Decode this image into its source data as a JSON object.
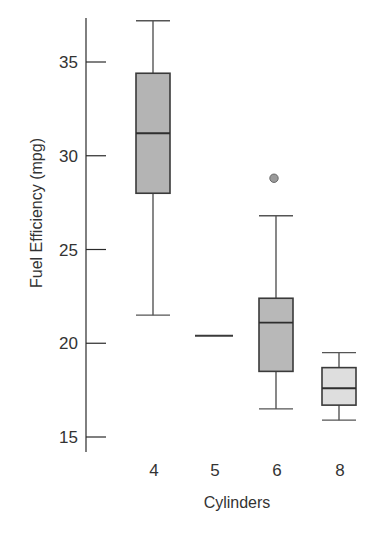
{
  "chart_data": {
    "type": "box",
    "title": "",
    "xlabel": "Cylinders",
    "ylabel": "Fuel Efficiency (mpg)",
    "ylim": [
      15,
      37.5
    ],
    "yticks": [
      15,
      20,
      25,
      30,
      35
    ],
    "grid": false,
    "legend": null,
    "categories": [
      "4",
      "5",
      "6",
      "8"
    ],
    "series": [
      {
        "name": "4",
        "whisker_low": 21.5,
        "q1": 28.0,
        "median": 31.2,
        "q3": 34.4,
        "whisker_high": 37.2,
        "outliers": [],
        "fill": "#b4b4b4"
      },
      {
        "name": "5",
        "whisker_low": 20.4,
        "q1": 20.4,
        "median": 20.4,
        "q3": 20.4,
        "whisker_high": 20.4,
        "outliers": [],
        "fill": "#b4b4b4"
      },
      {
        "name": "6",
        "whisker_low": 16.5,
        "q1": 18.5,
        "median": 21.1,
        "q3": 22.4,
        "whisker_high": 26.8,
        "outliers": [
          28.8
        ],
        "fill": "#b8b8b8"
      },
      {
        "name": "8",
        "whisker_low": 15.9,
        "q1": 16.7,
        "median": 17.6,
        "q3": 18.7,
        "whisker_high": 19.5,
        "outliers": [],
        "fill": "#dedede"
      }
    ]
  },
  "layout": {
    "axis_x": 86,
    "axis_top": 18,
    "axis_bottom": 452,
    "y_ref_value": 35,
    "y_ref_px": 62,
    "px_per_unit": 18.75,
    "category_x": [
      153,
      214,
      276,
      339
    ],
    "box_half_width": 17
  },
  "labels": {
    "cut_off_title": ""
  }
}
